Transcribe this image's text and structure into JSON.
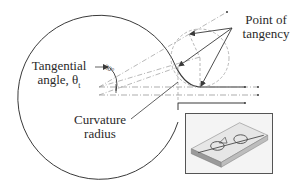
{
  "figure": {
    "labels": {
      "point_of_tangency_line1": "Point of",
      "point_of_tangency_line2": "tangency",
      "tangential_angle_line1": "Tangential",
      "tangential_angle_line2": "angle, θ",
      "tangential_angle_subscript": "t",
      "curvature_radius_line1": "Curvature",
      "curvature_radius_line2": "radius",
      "angle_dimension": "30°"
    },
    "inset": {
      "description": "3D rendering of microfluidic chip with circular channel loops"
    },
    "colors": {
      "stroke": "#3a3a3a",
      "construction": "#9a9a9a",
      "text": "#2a2a2a",
      "inset_border": "#555555"
    }
  }
}
